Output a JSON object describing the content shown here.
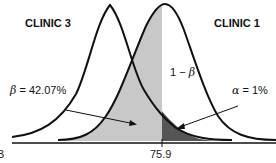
{
  "diagram": {
    "type": "overlapping-normal-distributions",
    "curves": [
      {
        "name": "CLINIC 3",
        "peak_x_px": 110,
        "position": "left"
      },
      {
        "name": "CLINIC 1",
        "peak_x_px": 165,
        "position": "right"
      }
    ],
    "critical_value": "75.9",
    "annotations": {
      "beta_symbol": "β",
      "beta_text": " = 42.07%",
      "power_text": "1 − ",
      "power_symbol": "β",
      "alpha_symbol": "α",
      "alpha_text": " = 1%"
    },
    "axis_edge_label": "B",
    "colors": {
      "beta_region": "#c8c8c8",
      "alpha_region": "#555555",
      "curve_stroke": "#111111",
      "background": "#ffffff"
    }
  },
  "labels": {
    "clinic_left": "CLINIC 3",
    "clinic_right": "CLINIC 1"
  }
}
